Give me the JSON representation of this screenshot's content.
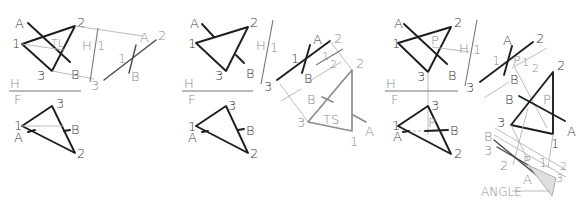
{
  "figure": {
    "panels": [
      {
        "id": "step-1",
        "views": {
          "horizontal": {
            "vertices": {
              "1": "1",
              "2": "2",
              "3": "3"
            },
            "line_ends": {
              "A": "A",
              "B": "B"
            },
            "true_length_mark": "TL"
          },
          "auxiliary_1": {
            "fold_label_left": "H",
            "fold_label_right": "1",
            "vertices": {
              "2": "2",
              "3": "3"
            },
            "line_ends": {
              "A": "A",
              "B": "B"
            },
            "edge_label": "1"
          },
          "frontal": {
            "vertices": {
              "1": "1",
              "2": "2",
              "3": "3"
            },
            "line_ends": {
              "A": "A",
              "B": "B"
            }
          },
          "fold_HF": {
            "top": "H",
            "bottom": "F"
          }
        }
      },
      {
        "id": "step-2",
        "views": {
          "horizontal": {
            "vertices": {
              "1": "1",
              "2": "2",
              "3": "3"
            },
            "line_ends": {
              "A": "A",
              "B": "B"
            }
          },
          "auxiliary_1": {
            "fold_label_left": "H",
            "fold_label_right": "1",
            "vertices": {
              "2": "2",
              "3": "3"
            },
            "line_ends": {
              "A": "A",
              "B": "B"
            },
            "edge_label": "1"
          },
          "auxiliary_2": {
            "fold_label_left": "1",
            "fold_label_right": "2",
            "vertices": {
              "1": "1",
              "2": "2",
              "3": "3"
            },
            "line_ends": {
              "A": "A",
              "B": "B"
            },
            "true_size_mark": "TS"
          },
          "frontal": {
            "vertices": {
              "1": "1",
              "2": "2",
              "3": "3"
            },
            "line_ends": {
              "A": "A",
              "B": "B"
            }
          },
          "fold_HF": {
            "top": "H",
            "bottom": "F"
          }
        }
      },
      {
        "id": "step-3",
        "views": {
          "horizontal": {
            "vertices": {
              "1": "1",
              "2": "2",
              "3": "3"
            },
            "line_ends": {
              "A": "A",
              "B": "B"
            },
            "pierce_point": "P"
          },
          "auxiliary_1": {
            "fold_label_left": "H",
            "fold_label_right": "1",
            "vertices": {
              "2": "2",
              "3": "3"
            },
            "line_ends": {
              "A": "A",
              "B": "B"
            },
            "edge_label": "1",
            "pierce_point": "P"
          },
          "auxiliary_2": {
            "fold_label_left": "1",
            "fold_label_right": "2",
            "vertices": {
              "1": "1",
              "2": "2",
              "3": "3"
            },
            "line_ends": {
              "A": "A",
              "B": "B"
            },
            "pierce_point": "P"
          },
          "auxiliary_3": {
            "fold_label_left": "2",
            "fold_label_right": "3",
            "vertices": {
              "1": "1",
              "2": "2",
              "3": "3"
            },
            "line_ends": {
              "A": "A",
              "B": "B"
            },
            "pierce_point": "P",
            "angle_label": "ANGLE"
          },
          "frontal": {
            "vertices": {
              "1": "1",
              "2": "2",
              "3": "3"
            },
            "line_ends": {
              "A": "A",
              "B": "B"
            },
            "pierce_point": "P"
          },
          "fold_HF": {
            "top": "H",
            "bottom": "F"
          }
        }
      }
    ]
  }
}
